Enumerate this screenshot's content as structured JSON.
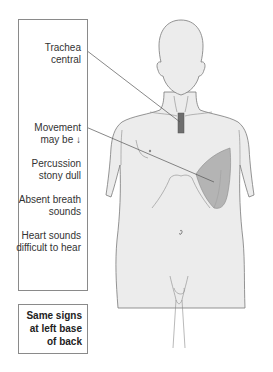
{
  "diagram": {
    "type": "clinical-sign-diagram",
    "signs": [
      {
        "id": "trachea",
        "line1": "Trachea",
        "line2": "central",
        "points_to": "trachea-marker"
      },
      {
        "id": "movement",
        "line1": "Movement",
        "line2": "may be ↓",
        "points_to": "left-lower-chest-effusion"
      },
      {
        "id": "percussion",
        "line1": "Percussion",
        "line2": "stony dull"
      },
      {
        "id": "breath",
        "line1": "Absent breath",
        "line2": "sounds"
      },
      {
        "id": "heart",
        "line1": "Heart sounds",
        "line2": "difficult to hear"
      }
    ],
    "note": {
      "line1": "Same signs",
      "line2": "at left base",
      "line3": "of back"
    },
    "colors": {
      "body_fill": "#ececec",
      "body_outline": "#7a7a7a",
      "effusion_fill": "#b4b4b4",
      "trachea_marker": "#6e6e6e",
      "leader_line": "#555555",
      "box_border": "#8a8a8a"
    }
  }
}
